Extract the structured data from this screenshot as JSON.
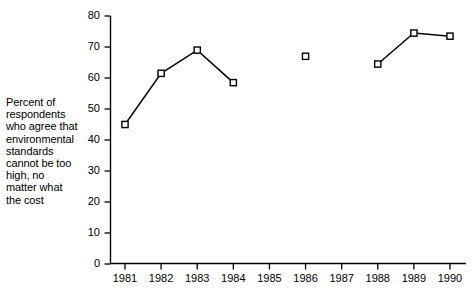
{
  "chart_data": {
    "type": "line",
    "title": "",
    "subtitle": "",
    "xlabel": "",
    "ylabel": "Percent of respondents who agree that environmental standards cannot be too high, no matter what the cost",
    "categories": [
      "1981",
      "1982",
      "1983",
      "1984",
      "1985",
      "1986",
      "1987",
      "1988",
      "1989",
      "1990"
    ],
    "x": [
      1981,
      1982,
      1983,
      1984,
      1985,
      1986,
      1987,
      1988,
      1989,
      1990
    ],
    "values": [
      45,
      61.5,
      69,
      58.5,
      null,
      67,
      null,
      64.5,
      74.5,
      73.5
    ],
    "series": [
      {
        "name": "Percent who agree",
        "values": [
          45,
          61.5,
          69,
          58.5,
          null,
          67,
          null,
          64.5,
          74.5,
          73.5
        ]
      }
    ],
    "segments": [
      {
        "points": [
          [
            1981,
            45
          ],
          [
            1982,
            61.5
          ],
          [
            1983,
            69
          ],
          [
            1984,
            58.5
          ]
        ]
      },
      {
        "points": [
          [
            1986,
            67
          ]
        ]
      },
      {
        "points": [
          [
            1988,
            64.5
          ],
          [
            1989,
            74.5
          ],
          [
            1990,
            73.5
          ]
        ]
      }
    ],
    "ylim": [
      0,
      80
    ],
    "xlim": [
      1980.6,
      1990.4
    ],
    "yticks": [
      0,
      10,
      20,
      30,
      40,
      50,
      60,
      70,
      80
    ],
    "ytick_labels": [
      "0",
      "10",
      "20",
      "30",
      "40",
      "50",
      "60",
      "70",
      "80"
    ],
    "xtick_labels": [
      "1981",
      "1982",
      "1983",
      "1984",
      "1985",
      "1986",
      "1987",
      "1988",
      "1989",
      "1990"
    ],
    "grid": false,
    "legend": false,
    "legend_position": "none",
    "marker": "open-square",
    "line_color": "#000000",
    "marker_face_color": "#ffffff",
    "marker_edge_color": "#000000",
    "missing_years": [
      1985,
      1987
    ],
    "annotations": []
  },
  "axis_caption": {
    "lines": [
      "Percent of",
      "respondents",
      "who agree that",
      "environmental",
      "standards",
      "cannot be too",
      "high, no",
      "matter what",
      "the cost"
    ],
    "text": "Percent of respondents who agree that environmental standards cannot be too high, no matter what the cost"
  }
}
